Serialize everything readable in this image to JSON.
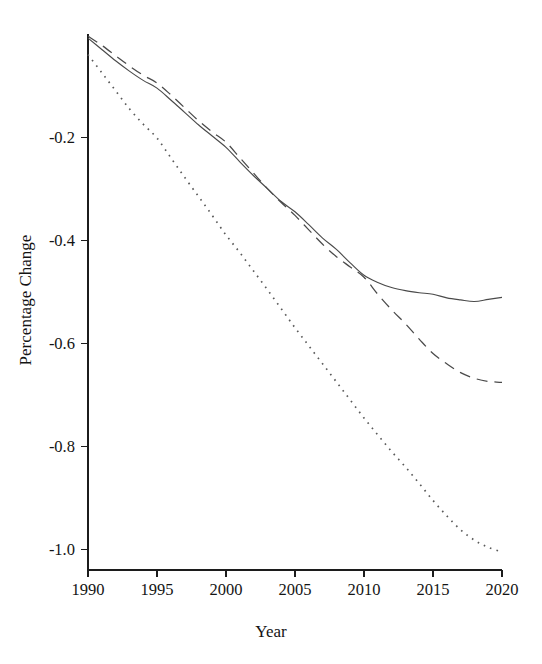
{
  "chart_data": {
    "type": "line",
    "title": "",
    "subtitle": "",
    "xlabel": "Year",
    "ylabel": "Percentage Change",
    "xlim": [
      1990,
      2020
    ],
    "ylim": [
      -1.04,
      0.0
    ],
    "xticks": [
      1990,
      1995,
      2000,
      2005,
      2010,
      2015,
      2020
    ],
    "xtick_labels": [
      "1990",
      "1995",
      "2000",
      "2005",
      "2010",
      "2015",
      "2020"
    ],
    "yticks": [
      -0.2,
      -0.4,
      -0.6,
      -0.8,
      -1.0
    ],
    "ytick_labels": [
      "-0.2",
      "-0.4",
      "-0.6",
      "-0.8",
      "-1.0"
    ],
    "grid": false,
    "legend": null,
    "legend_position": "none",
    "annotations": [],
    "x": [
      1990,
      1991,
      1992,
      1993,
      1994,
      1995,
      1996,
      1997,
      1998,
      1999,
      2000,
      2001,
      2002,
      2003,
      2004,
      2005,
      2006,
      2007,
      2008,
      2009,
      2010,
      2011,
      2012,
      2013,
      2014,
      2015,
      2016,
      2017,
      2018,
      2019,
      2020
    ],
    "series": [
      {
        "name": "solid-series",
        "style": "solid",
        "color": "#4a4a4a",
        "values": [
          -0.008,
          -0.03,
          -0.052,
          -0.072,
          -0.09,
          -0.105,
          -0.128,
          -0.152,
          -0.176,
          -0.198,
          -0.22,
          -0.248,
          -0.275,
          -0.3,
          -0.325,
          -0.345,
          -0.37,
          -0.396,
          -0.418,
          -0.444,
          -0.468,
          -0.482,
          -0.492,
          -0.498,
          -0.502,
          -0.505,
          -0.512,
          -0.516,
          -0.519,
          -0.515,
          -0.511
        ]
      },
      {
        "name": "dashed-series",
        "style": "dashed",
        "color": "#4a4a4a",
        "values": [
          -0.004,
          -0.022,
          -0.042,
          -0.062,
          -0.08,
          -0.095,
          -0.118,
          -0.143,
          -0.168,
          -0.19,
          -0.21,
          -0.24,
          -0.27,
          -0.3,
          -0.327,
          -0.352,
          -0.38,
          -0.408,
          -0.432,
          -0.452,
          -0.472,
          -0.505,
          -0.535,
          -0.562,
          -0.592,
          -0.62,
          -0.64,
          -0.657,
          -0.668,
          -0.674,
          -0.676
        ]
      },
      {
        "name": "dotted-series",
        "style": "dotted",
        "color": "#5a5a5a",
        "values": [
          -0.04,
          -0.075,
          -0.11,
          -0.145,
          -0.175,
          -0.202,
          -0.24,
          -0.278,
          -0.315,
          -0.352,
          -0.39,
          -0.424,
          -0.46,
          -0.496,
          -0.533,
          -0.57,
          -0.605,
          -0.64,
          -0.675,
          -0.71,
          -0.745,
          -0.778,
          -0.81,
          -0.84,
          -0.872,
          -0.905,
          -0.935,
          -0.962,
          -0.982,
          -0.996,
          -1.005
        ]
      }
    ]
  },
  "plot_geometry": {
    "left": 88,
    "right": 502,
    "top": 34,
    "bottom": 570
  }
}
